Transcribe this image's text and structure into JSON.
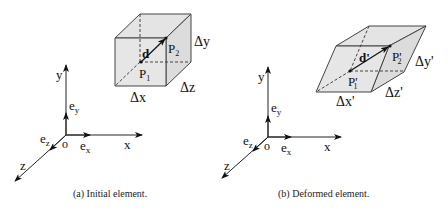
{
  "figure_a": {
    "caption": "(a)  Initial element.",
    "axes": {
      "x": "x",
      "y": "y",
      "z": "z",
      "origin": "o"
    },
    "basis": {
      "ex": "e",
      "ex_sub": "x",
      "ey": "e",
      "ey_sub": "y",
      "ez": "e",
      "ez_sub": "z"
    },
    "element": {
      "vector": "d",
      "p1": "P",
      "p1_sub": "1",
      "p2": "P",
      "p2_sub": "2",
      "dx": "Δx",
      "dy": "Δy",
      "dz": "Δz"
    }
  },
  "figure_b": {
    "caption": "(b)  Deformed element.",
    "axes": {
      "x": "x",
      "y": "y",
      "z": "z",
      "origin": "o"
    },
    "basis": {
      "ex": "e",
      "ex_sub": "x",
      "ey": "e",
      "ey_sub": "y",
      "ez": "e",
      "ez_sub": "z"
    },
    "element": {
      "vector": "d'",
      "p1": "P'",
      "p1_sub": "1",
      "p2": "P'",
      "p2_sub": "2",
      "dx": "Δx'",
      "dy": "Δy'",
      "dz": "Δz'"
    }
  },
  "colors": {
    "face_fill": "#e6e6e6",
    "stroke": "#333333"
  }
}
